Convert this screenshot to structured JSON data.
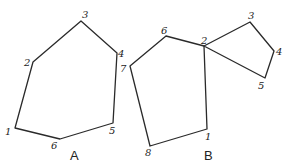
{
  "figures": [
    {
      "id": "A",
      "label": "A",
      "label_pos": [
        70,
        160
      ],
      "vertices": [
        {
          "name": "1",
          "x": 15,
          "y": 128,
          "lx": 5,
          "ly": 135
        },
        {
          "name": "2",
          "x": 33,
          "y": 62,
          "lx": 24,
          "ly": 66
        },
        {
          "name": "3",
          "x": 81,
          "y": 21,
          "lx": 82,
          "ly": 18
        },
        {
          "name": "4",
          "x": 117,
          "y": 53,
          "lx": 118,
          "ly": 57
        },
        {
          "name": "5",
          "x": 113,
          "y": 123,
          "lx": 109,
          "ly": 134
        },
        {
          "name": "6",
          "x": 60,
          "y": 139,
          "lx": 51,
          "ly": 149
        }
      ],
      "polygon_order": [
        "1",
        "2",
        "3",
        "4",
        "5",
        "6"
      ]
    },
    {
      "id": "B",
      "label": "B",
      "label_pos": [
        204,
        160
      ],
      "vertices": [
        {
          "name": "1",
          "x": 207,
          "y": 129,
          "lx": 205,
          "ly": 140
        },
        {
          "name": "2",
          "x": 204,
          "y": 46,
          "lx": 201,
          "ly": 44
        },
        {
          "name": "3",
          "x": 250,
          "y": 22,
          "lx": 248,
          "ly": 19
        },
        {
          "name": "4",
          "x": 274,
          "y": 51,
          "lx": 276,
          "ly": 55
        },
        {
          "name": "5",
          "x": 265,
          "y": 78,
          "lx": 258,
          "ly": 89
        },
        {
          "name": "6",
          "x": 166,
          "y": 36,
          "lx": 161,
          "ly": 34
        },
        {
          "name": "7",
          "x": 130,
          "y": 66,
          "lx": 120,
          "ly": 72
        },
        {
          "name": "8",
          "x": 150,
          "y": 146,
          "lx": 145,
          "ly": 156
        }
      ],
      "polygons": [
        [
          "1",
          "2",
          "6",
          "7",
          "8"
        ],
        [
          "2",
          "3",
          "4",
          "5"
        ]
      ]
    }
  ]
}
